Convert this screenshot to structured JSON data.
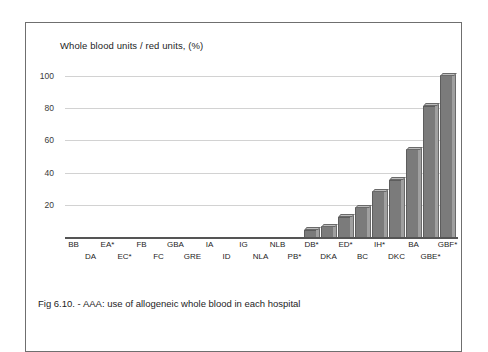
{
  "figure": {
    "caption": "Fig 6.10. - AAA: use of allogeneic whole blood in each hospital",
    "border_color": "#6f6f6f"
  },
  "chart_data": {
    "type": "bar",
    "title": "Whole blood units /  red units,  (%)",
    "xlabel": "",
    "ylabel": "",
    "ylim": [
      0,
      108
    ],
    "yticks": [
      20,
      40,
      60,
      80,
      100
    ],
    "grid": true,
    "legend": "none",
    "bar_color": "#7b7b7b",
    "bar_side_color": "#a0a0a0",
    "bar_top_color": "#bdbdbd",
    "categories": [
      "BB",
      "DA",
      "EA*",
      "EC*",
      "FB",
      "FC",
      "GBA",
      "GRE",
      "IA",
      "ID",
      "IG",
      "NLA",
      "NLB",
      "PB*",
      "DB*",
      "DKA",
      "ED*",
      "BC",
      "IH*",
      "DKC",
      "BA",
      "GBE*",
      "GBF*"
    ],
    "values": [
      0,
      0,
      0,
      0,
      0,
      0,
      0,
      0,
      0,
      0,
      0,
      0,
      0,
      0,
      4,
      6,
      12,
      18,
      28,
      35,
      54,
      81,
      100
    ]
  }
}
